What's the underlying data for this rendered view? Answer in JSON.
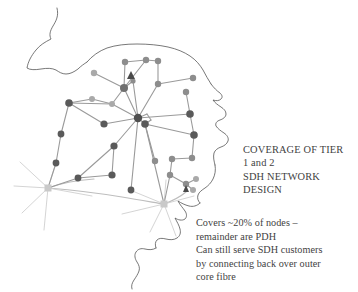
{
  "slide": {
    "background_color": "#ffffff",
    "kind": "network-coverage-map-slide"
  },
  "title": {
    "lines": [
      "COVERAGE OF TIER",
      "1 and 2",
      "SDH NETWORK",
      "DESIGN"
    ]
  },
  "body": {
    "lines": [
      "Covers ~20% of nodes –",
      "remainder are PDH",
      "Can still serve SDH customers",
      "by connecting back over outer",
      "core fibre"
    ]
  },
  "map": {
    "coastline_color": "#555555",
    "edge_color": "#9a9a9a",
    "edge_color_dark": "#6f6f6f",
    "node_color_dark": "#5a5a5a",
    "node_color_mid": "#8d8d8d",
    "node_color_light": "#a9a9a9",
    "gateway_color": "#c9c9c9",
    "marker_color": "#4a4a4a",
    "node_count_label": "",
    "legend": {
      "node_kind": "sdh-node",
      "gateway_kind": "core-gateway-burst",
      "marker_kind": "tier-marker-triangle"
    }
  }
}
